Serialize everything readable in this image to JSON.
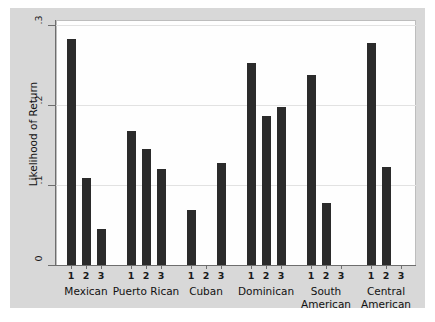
{
  "chart_data": {
    "type": "bar",
    "title": "",
    "xlabel": "",
    "ylabel": "Likelihood of Return",
    "ylim": [
      0,
      0.3
    ],
    "yticks": [
      0,
      0.1,
      0.2,
      0.3
    ],
    "ytick_labels": [
      "0",
      ".1",
      ".2",
      ".3"
    ],
    "grid": true,
    "legend": "none",
    "categories": [
      "Mexican",
      "Puerto Rican",
      "Cuban",
      "Dominican",
      "South American",
      "Central American"
    ],
    "subcategories": [
      "1",
      "2",
      "3"
    ],
    "groups": [
      {
        "label": "Mexican",
        "label_line1": "Mexican",
        "label_line2": "",
        "bars": [
          {
            "tick": "1",
            "value": 0.283
          },
          {
            "tick": "2",
            "value": 0.109
          },
          {
            "tick": "3",
            "value": 0.045
          }
        ]
      },
      {
        "label": "Puerto Rican",
        "label_line1": "Puerto Rican",
        "label_line2": "",
        "bars": [
          {
            "tick": "1",
            "value": 0.168
          },
          {
            "tick": "2",
            "value": 0.145
          },
          {
            "tick": "3",
            "value": 0.12
          }
        ]
      },
      {
        "label": "Cuban",
        "label_line1": "Cuban",
        "label_line2": "",
        "bars": [
          {
            "tick": "1",
            "value": 0.069
          },
          {
            "tick": "2",
            "value": 0
          },
          {
            "tick": "3",
            "value": 0.128
          }
        ]
      },
      {
        "label": "Dominican",
        "label_line1": "Dominican",
        "label_line2": "",
        "bars": [
          {
            "tick": "1",
            "value": 0.252
          },
          {
            "tick": "2",
            "value": 0.186
          },
          {
            "tick": "3",
            "value": 0.198
          }
        ]
      },
      {
        "label": "South American",
        "label_line1": "South",
        "label_line2": "American",
        "bars": [
          {
            "tick": "1",
            "value": 0.238
          },
          {
            "tick": "2",
            "value": 0.078
          },
          {
            "tick": "3",
            "value": 0
          }
        ]
      },
      {
        "label": "Central American",
        "label_line1": "Central",
        "label_line2": "American",
        "bars": [
          {
            "tick": "1",
            "value": 0.277
          },
          {
            "tick": "2",
            "value": 0.122
          },
          {
            "tick": "3",
            "value": 0
          }
        ]
      }
    ],
    "colors": {
      "bar": "#2b2b2b",
      "plot_background": "#fefefe",
      "figure_background": "#d8d8d8",
      "gridline": "#e2e2e2",
      "axis": "#6e6e6e",
      "text": "#111111"
    }
  }
}
